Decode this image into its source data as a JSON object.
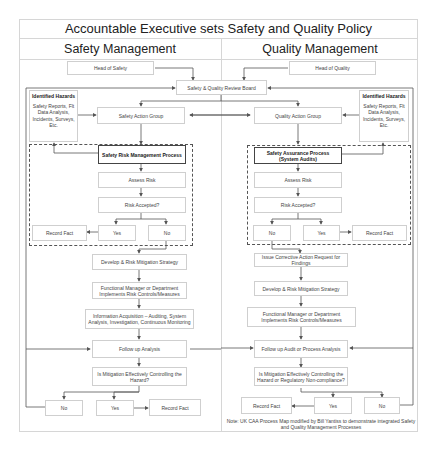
{
  "title": "Accountable Executive sets Safety and Quality Policy",
  "columns": {
    "safety": "Safety Management",
    "quality": "Quality Management"
  },
  "top": {
    "head_of_safety": "Head of Safety",
    "head_of_quality": "Head of Quality",
    "review_board": "Safety & Quality Review Board"
  },
  "safety": {
    "hazards_heading": "Identified Hazards",
    "hazards_text": "Safety Reports, Flt Data Analysis, Incidents, Surveys, Etc.",
    "action_group": "Safety Action Group",
    "process": "Safety Risk Management Process",
    "assess": "Assess Risk",
    "accepted": "Risk Accepted?",
    "record_fact": "Record Fact",
    "yes": "Yes",
    "no": "No",
    "develop": "Develop & Risk Mitigation Strategy",
    "implements": "Functional Manager or Department Implements Risk Controls/Measures",
    "info": "Information Acquisition – Auditing, System Analysis, Investigation, Continuous Monitoring",
    "follow_up": "Follow up Analysis",
    "effective": "Is Mitigation Effectively Controlling the Hazard?",
    "no2": "No",
    "yes2": "Yes",
    "record_fact2": "Record Fact"
  },
  "quality": {
    "hazards_heading": "Identified Hazards",
    "hazards_text": "Safety Reports, Flt Data Analysis, Incidents, Surveys, Etc.",
    "action_group": "Quality Action Group",
    "process": "Safety Assurance Process (System Audits)",
    "assess": "Assess Risk",
    "accepted": "Risk Accepted?",
    "no": "No",
    "yes": "Yes",
    "record_fact": "Record Fact",
    "corrective": "Issue Corrective Action Request for Findings",
    "develop": "Develop & Risk Mitigation Strategy",
    "implements": "Functional Manager or Department Implements Risk Controls/Measures",
    "follow_up": "Follow up Audit or Process Analysis",
    "effective": "Is Mitigation Effectively Controlling the Hazard or Regulatory Non-compliance?",
    "record_fact2": "Record Fact",
    "yes2": "Yes",
    "no2": "No"
  },
  "note": "Note: UK CAA Process Map modified by Bill Yantiss to demonstrate integrated Safety and Quality Management Processes"
}
